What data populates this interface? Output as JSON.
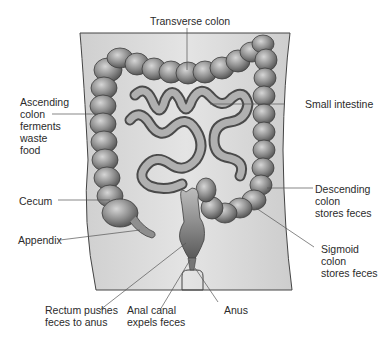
{
  "figure": {
    "colors": {
      "background": "#ffffff",
      "body_panel": "#d9d9d9",
      "organ_fill": "#9a9a9a",
      "organ_dark": "#5a5a5a",
      "organ_highlight": "#cfcfcf",
      "leader_line": "#555555",
      "text": "#2b2b2b"
    },
    "labels": {
      "transverse_colon": "Transverse colon",
      "ascending_colon": "Ascending\ncolon\nferments\nwaste\nfood",
      "small_intestine": "Small intestine",
      "cecum": "Cecum",
      "appendix": "Appendix",
      "descending_colon": "Descending\ncolon\nstores feces",
      "sigmoid_colon": "Sigmoid\ncolon\nstores feces",
      "rectum": "Rectum pushes\nfeces to anus",
      "anal_canal": "Anal canal\nexpels feces",
      "anus": "Anus"
    }
  }
}
